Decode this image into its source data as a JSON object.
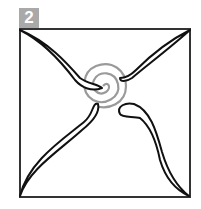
{
  "step": {
    "number": "2"
  },
  "diagram": {
    "colors": {
      "frame": "#222222",
      "stroke": "#111111",
      "spiral": "#999999",
      "badge": "#a9a9a9"
    }
  }
}
